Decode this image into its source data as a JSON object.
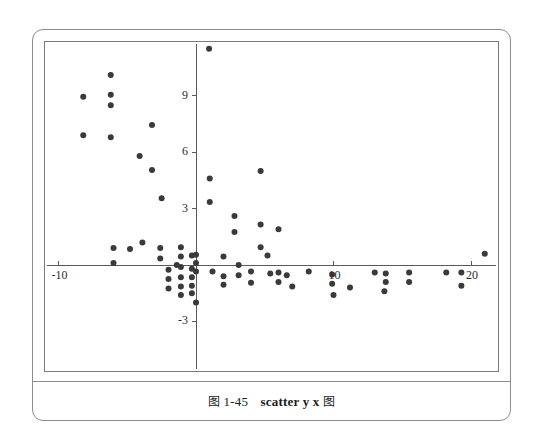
{
  "figure": {
    "caption_prefix_glyph": "图",
    "caption_number": "1-45",
    "caption_command": "scatter y x",
    "caption_suffix_glyph": "图",
    "frame_color": "#8d8d8d",
    "plot_frame_color": "#7a7a7a",
    "point_color": "#3a3a3a",
    "axis_color": "#5a5a5a",
    "background": "#ffffff"
  },
  "chart_data": {
    "type": "scatter",
    "title": "",
    "xlabel": "x",
    "ylabel": "y",
    "grid": false,
    "legend": "none",
    "xlim": [
      -11.5,
      22.2
    ],
    "ylim": [
      -4.2,
      12.2
    ],
    "xticks": [
      -10,
      10,
      20
    ],
    "xtick_labels": [
      "-10",
      "10",
      "20"
    ],
    "yticks": [
      9,
      6,
      3,
      -3
    ],
    "ytick_labels": [
      "9",
      "6",
      "3",
      "-3"
    ],
    "axis_origin": [
      0,
      0
    ],
    "marker": "filled-circle",
    "marker_size_px": 6,
    "points": [
      [
        0.95,
        11.5
      ],
      [
        -8.2,
        8.95
      ],
      [
        -6.2,
        10.1
      ],
      [
        -6.2,
        9.05
      ],
      [
        -6.2,
        8.5
      ],
      [
        -8.2,
        6.9
      ],
      [
        -6.2,
        6.8
      ],
      [
        -3.2,
        7.45
      ],
      [
        -4.1,
        5.8
      ],
      [
        -3.2,
        5.05
      ],
      [
        -2.5,
        3.55
      ],
      [
        1.0,
        4.6
      ],
      [
        1.0,
        3.35
      ],
      [
        4.7,
        5.0
      ],
      [
        2.8,
        2.6
      ],
      [
        2.8,
        1.75
      ],
      [
        4.7,
        2.15
      ],
      [
        6.0,
        1.9
      ],
      [
        4.7,
        0.95
      ],
      [
        -3.9,
        1.2
      ],
      [
        -6.0,
        0.9
      ],
      [
        -4.8,
        0.85
      ],
      [
        -6.0,
        0.1
      ],
      [
        -2.6,
        0.9
      ],
      [
        -2.6,
        0.35
      ],
      [
        -1.1,
        0.95
      ],
      [
        -1.1,
        0.45
      ],
      [
        -1.1,
        -0.1
      ],
      [
        -1.4,
        0.0
      ],
      [
        -2.0,
        -0.25
      ],
      [
        -2.0,
        -0.75
      ],
      [
        -2.0,
        -1.25
      ],
      [
        -1.1,
        -0.65
      ],
      [
        -1.1,
        -1.15
      ],
      [
        -1.1,
        -1.6
      ],
      [
        -0.3,
        0.5
      ],
      [
        -0.3,
        -0.2
      ],
      [
        -0.3,
        -0.65
      ],
      [
        -0.3,
        -1.1
      ],
      [
        -0.3,
        -1.5
      ],
      [
        0.0,
        0.55
      ],
      [
        0.0,
        0.1
      ],
      [
        0.0,
        -0.35
      ],
      [
        0.0,
        -2.0
      ],
      [
        1.2,
        -0.35
      ],
      [
        2.0,
        0.45
      ],
      [
        2.0,
        -0.6
      ],
      [
        2.0,
        -1.05
      ],
      [
        3.1,
        0.0
      ],
      [
        3.1,
        -0.55
      ],
      [
        4.0,
        -0.35
      ],
      [
        4.0,
        -0.95
      ],
      [
        5.2,
        0.5
      ],
      [
        5.4,
        -0.45
      ],
      [
        6.0,
        -0.4
      ],
      [
        6.0,
        -0.9
      ],
      [
        6.6,
        -0.55
      ],
      [
        7.0,
        -1.15
      ],
      [
        8.2,
        -0.35
      ],
      [
        9.9,
        -0.5
      ],
      [
        9.9,
        -1.0
      ],
      [
        10.0,
        -1.6
      ],
      [
        11.2,
        -1.2
      ],
      [
        13.0,
        -0.4
      ],
      [
        13.7,
        -1.4
      ],
      [
        13.8,
        -0.45
      ],
      [
        13.8,
        -0.9
      ],
      [
        15.5,
        -0.4
      ],
      [
        15.5,
        -0.9
      ],
      [
        18.2,
        -0.4
      ],
      [
        19.3,
        -0.4
      ],
      [
        19.3,
        -1.1
      ],
      [
        21.0,
        0.6
      ]
    ]
  }
}
